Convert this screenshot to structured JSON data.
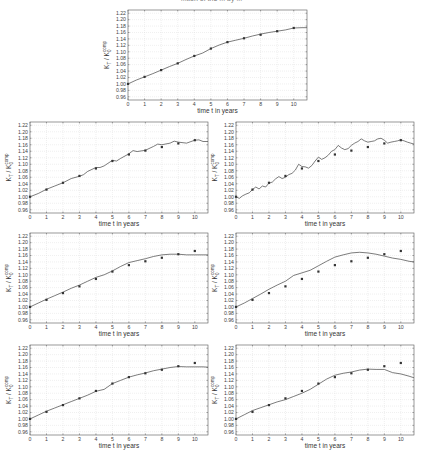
{
  "header": {
    "caption_fragment": "...tion of the ... by ..."
  },
  "chart_data": [
    {
      "id": "panel-top",
      "type": "line",
      "xlabel": "time t in years",
      "ylabel": "K_T / K_0^comp",
      "xlim": [
        0,
        10.8
      ],
      "ylim": [
        0.95,
        1.23
      ],
      "xticks": [
        0,
        1,
        2,
        3,
        4,
        5,
        6,
        7,
        8,
        9,
        10
      ],
      "yticks": [
        0.96,
        0.98,
        1.0,
        1.02,
        1.04,
        1.06,
        1.08,
        1.1,
        1.12,
        1.14,
        1.16,
        1.18,
        1.2,
        1.22
      ],
      "grid": true,
      "markers": {
        "x": [
          0,
          1,
          2,
          3,
          4,
          5,
          6,
          7,
          8,
          9,
          10
        ],
        "y": [
          1.0,
          1.022,
          1.043,
          1.064,
          1.087,
          1.11,
          1.13,
          1.142,
          1.153,
          1.164,
          1.174
        ]
      },
      "line": {
        "x": [
          0,
          0.5,
          1,
          1.5,
          2,
          2.5,
          3,
          3.5,
          4,
          4.5,
          5,
          5.5,
          6,
          6.5,
          7,
          7.5,
          8,
          8.5,
          9,
          9.5,
          10,
          10.5,
          10.8
        ],
        "y": [
          1.0,
          1.012,
          1.022,
          1.032,
          1.043,
          1.054,
          1.064,
          1.076,
          1.087,
          1.096,
          1.11,
          1.121,
          1.13,
          1.136,
          1.142,
          1.149,
          1.155,
          1.16,
          1.164,
          1.168,
          1.174,
          1.175,
          1.175
        ]
      }
    },
    {
      "id": "panel-row2-left",
      "type": "line",
      "xlabel": "time t in years",
      "ylabel": "K_T / K_0^comp",
      "xlim": [
        0,
        10.8
      ],
      "ylim": [
        0.95,
        1.23
      ],
      "xticks": [
        0,
        1,
        2,
        3,
        4,
        5,
        6,
        7,
        8,
        9,
        10
      ],
      "yticks": [
        0.96,
        0.98,
        1.0,
        1.02,
        1.04,
        1.06,
        1.08,
        1.1,
        1.12,
        1.14,
        1.16,
        1.18,
        1.2,
        1.22
      ],
      "grid": true,
      "markers": {
        "x": [
          0,
          1,
          2,
          3,
          4,
          5,
          6,
          7,
          8,
          9,
          10
        ],
        "y": [
          1.0,
          1.022,
          1.043,
          1.064,
          1.087,
          1.11,
          1.13,
          1.142,
          1.153,
          1.164,
          1.174
        ]
      },
      "line": {
        "x": [
          0,
          0.5,
          1,
          1.5,
          2,
          2.5,
          3,
          3.25,
          3.5,
          4,
          4.25,
          4.5,
          5,
          5.25,
          5.5,
          6,
          6.25,
          6.5,
          7,
          7.5,
          7.75,
          8,
          8.5,
          8.75,
          9,
          9.5,
          10,
          10.25,
          10.5,
          10.8
        ],
        "y": [
          1.0,
          1.01,
          1.023,
          1.033,
          1.043,
          1.056,
          1.063,
          1.068,
          1.078,
          1.09,
          1.09,
          1.095,
          1.112,
          1.11,
          1.118,
          1.132,
          1.142,
          1.139,
          1.143,
          1.155,
          1.162,
          1.16,
          1.165,
          1.171,
          1.168,
          1.165,
          1.174,
          1.175,
          1.17,
          1.17
        ]
      }
    },
    {
      "id": "panel-row2-right",
      "type": "line",
      "xlabel": "time t in years",
      "ylabel": "K_T / K_0^comp",
      "xlim": [
        0,
        10.8
      ],
      "ylim": [
        0.95,
        1.23
      ],
      "xticks": [
        0,
        1,
        2,
        3,
        4,
        5,
        6,
        7,
        8,
        9,
        10
      ],
      "yticks": [
        0.96,
        0.98,
        1.0,
        1.02,
        1.04,
        1.06,
        1.08,
        1.1,
        1.12,
        1.14,
        1.16,
        1.18,
        1.2,
        1.22
      ],
      "grid": true,
      "markers": {
        "x": [
          0,
          1,
          2,
          3,
          4,
          5,
          6,
          7,
          8,
          9,
          10
        ],
        "y": [
          1.0,
          1.022,
          1.043,
          1.064,
          1.087,
          1.11,
          1.13,
          1.142,
          1.153,
          1.164,
          1.174
        ]
      },
      "line": {
        "x": [
          0,
          0.2,
          0.4,
          0.6,
          0.8,
          1.0,
          1.2,
          1.4,
          1.6,
          1.8,
          2.0,
          2.2,
          2.4,
          2.6,
          2.8,
          3.0,
          3.2,
          3.4,
          3.6,
          3.8,
          4.0,
          4.2,
          4.4,
          4.6,
          4.8,
          5.0,
          5.2,
          5.4,
          5.6,
          5.8,
          6.0,
          6.2,
          6.4,
          6.6,
          6.8,
          7.0,
          7.2,
          7.4,
          7.6,
          7.8,
          8.0,
          8.2,
          8.4,
          8.6,
          8.8,
          9.0,
          9.2,
          9.4,
          9.6,
          9.8,
          10.0,
          10.2,
          10.4,
          10.6,
          10.8
        ],
        "y": [
          1.0,
          0.995,
          1.003,
          1.008,
          1.012,
          1.022,
          1.03,
          1.024,
          1.033,
          1.03,
          1.042,
          1.045,
          1.055,
          1.062,
          1.056,
          1.06,
          1.068,
          1.072,
          1.082,
          1.1,
          1.093,
          1.092,
          1.088,
          1.096,
          1.11,
          1.122,
          1.115,
          1.12,
          1.128,
          1.14,
          1.145,
          1.158,
          1.15,
          1.145,
          1.148,
          1.158,
          1.165,
          1.17,
          1.178,
          1.172,
          1.168,
          1.17,
          1.172,
          1.178,
          1.18,
          1.174,
          1.165,
          1.168,
          1.17,
          1.172,
          1.175,
          1.172,
          1.168,
          1.165,
          1.162
        ]
      }
    },
    {
      "id": "panel-row3-left",
      "type": "line",
      "xlabel": "time t in years",
      "ylabel": "K_T / K_0^comp",
      "xlim": [
        0,
        10.8
      ],
      "ylim": [
        0.95,
        1.23
      ],
      "xticks": [
        0,
        1,
        2,
        3,
        4,
        5,
        6,
        7,
        8,
        9,
        10
      ],
      "yticks": [
        0.96,
        0.98,
        1.0,
        1.02,
        1.04,
        1.06,
        1.08,
        1.1,
        1.12,
        1.14,
        1.16,
        1.18,
        1.2,
        1.22
      ],
      "grid": true,
      "markers": {
        "x": [
          0,
          1,
          2,
          3,
          4,
          5,
          6,
          7,
          8,
          9,
          10
        ],
        "y": [
          1.0,
          1.022,
          1.043,
          1.064,
          1.087,
          1.11,
          1.13,
          1.142,
          1.153,
          1.164,
          1.174
        ]
      },
      "line": {
        "x": [
          0,
          0.5,
          1,
          1.5,
          2,
          2.5,
          3,
          3.5,
          4,
          4.5,
          5,
          5.5,
          6,
          6.5,
          7,
          7.5,
          8,
          8.5,
          9,
          9.5,
          10,
          10.5,
          10.8
        ],
        "y": [
          1.0,
          1.012,
          1.024,
          1.035,
          1.046,
          1.058,
          1.068,
          1.08,
          1.092,
          1.1,
          1.112,
          1.126,
          1.138,
          1.144,
          1.15,
          1.157,
          1.162,
          1.164,
          1.164,
          1.162,
          1.162,
          1.162,
          1.162
        ]
      }
    },
    {
      "id": "panel-row3-right",
      "type": "line",
      "xlabel": "time t in years",
      "ylabel": "K_T / K_0^comp",
      "xlim": [
        0,
        10.8
      ],
      "ylim": [
        0.95,
        1.23
      ],
      "xticks": [
        0,
        1,
        2,
        3,
        4,
        5,
        6,
        7,
        8,
        9,
        10
      ],
      "yticks": [
        0.96,
        0.98,
        1.0,
        1.02,
        1.04,
        1.06,
        1.08,
        1.1,
        1.12,
        1.14,
        1.16,
        1.18,
        1.2,
        1.22
      ],
      "grid": true,
      "markers": {
        "x": [
          0,
          1,
          2,
          3,
          4,
          5,
          6,
          7,
          8,
          9,
          10
        ],
        "y": [
          1.0,
          1.022,
          1.043,
          1.064,
          1.087,
          1.11,
          1.13,
          1.142,
          1.153,
          1.164,
          1.174
        ]
      },
      "line": {
        "x": [
          0,
          0.5,
          1,
          1.5,
          2,
          2.5,
          3,
          3.5,
          4,
          4.5,
          5,
          5.5,
          6,
          6.5,
          7,
          7.5,
          8,
          8.5,
          9,
          9.5,
          10,
          10.5,
          10.8
        ],
        "y": [
          1.0,
          1.012,
          1.026,
          1.04,
          1.055,
          1.068,
          1.08,
          1.098,
          1.106,
          1.114,
          1.128,
          1.142,
          1.155,
          1.162,
          1.168,
          1.17,
          1.168,
          1.164,
          1.158,
          1.152,
          1.148,
          1.142,
          1.14
        ]
      }
    },
    {
      "id": "panel-row4-left",
      "type": "line",
      "xlabel": "time t in years",
      "ylabel": "K_T / K_0^comp",
      "xlim": [
        0,
        10.8
      ],
      "ylim": [
        0.95,
        1.23
      ],
      "xticks": [
        0,
        1,
        2,
        3,
        4,
        5,
        6,
        7,
        8,
        9,
        10
      ],
      "yticks": [
        0.96,
        0.98,
        1.0,
        1.02,
        1.04,
        1.06,
        1.08,
        1.1,
        1.12,
        1.14,
        1.16,
        1.18,
        1.2,
        1.22
      ],
      "grid": true,
      "markers": {
        "x": [
          0,
          1,
          2,
          3,
          4,
          5,
          6,
          7,
          8,
          9,
          10
        ],
        "y": [
          1.0,
          1.022,
          1.043,
          1.064,
          1.087,
          1.11,
          1.13,
          1.142,
          1.153,
          1.164,
          1.174
        ]
      },
      "line": {
        "x": [
          0,
          0.5,
          1,
          1.5,
          2,
          2.5,
          3,
          3.5,
          4,
          4.5,
          5,
          5.5,
          6,
          6.5,
          7,
          7.5,
          8,
          8.5,
          9,
          9.5,
          10,
          10.5,
          10.8
        ],
        "y": [
          1.0,
          1.012,
          1.024,
          1.034,
          1.044,
          1.054,
          1.064,
          1.074,
          1.086,
          1.092,
          1.11,
          1.12,
          1.13,
          1.137,
          1.143,
          1.15,
          1.155,
          1.16,
          1.163,
          1.162,
          1.162,
          1.162,
          1.161
        ]
      }
    },
    {
      "id": "panel-row4-right",
      "type": "line",
      "xlabel": "time t in years",
      "ylabel": "K_T / K_0^comp",
      "xlim": [
        0,
        10.8
      ],
      "ylim": [
        0.95,
        1.23
      ],
      "xticks": [
        0,
        1,
        2,
        3,
        4,
        5,
        6,
        7,
        8,
        9,
        10
      ],
      "yticks": [
        0.96,
        0.98,
        1.0,
        1.02,
        1.04,
        1.06,
        1.08,
        1.1,
        1.12,
        1.14,
        1.16,
        1.18,
        1.2,
        1.22
      ],
      "grid": true,
      "markers": {
        "x": [
          0,
          1,
          2,
          3,
          4,
          5,
          6,
          7,
          8,
          9,
          10
        ],
        "y": [
          1.0,
          1.022,
          1.043,
          1.064,
          1.087,
          1.11,
          1.13,
          1.142,
          1.153,
          1.164,
          1.174
        ]
      },
      "line": {
        "x": [
          0,
          0.5,
          1,
          1.5,
          2,
          2.5,
          3,
          3.5,
          4,
          4.5,
          5,
          5.5,
          6,
          6.5,
          7,
          7.5,
          8,
          8.5,
          9,
          9.5,
          10,
          10.5,
          10.8
        ],
        "y": [
          1.0,
          1.013,
          1.026,
          1.035,
          1.044,
          1.053,
          1.06,
          1.07,
          1.08,
          1.092,
          1.108,
          1.124,
          1.136,
          1.142,
          1.146,
          1.152,
          1.155,
          1.154,
          1.154,
          1.144,
          1.14,
          1.133,
          1.128
        ]
      }
    }
  ]
}
